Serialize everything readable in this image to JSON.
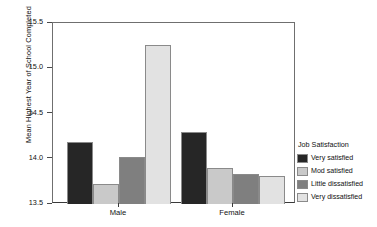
{
  "chart_data": {
    "type": "bar",
    "title": "",
    "xlabel": "",
    "ylabel": "Mean Highest Year of School Completed",
    "categories": [
      "Male",
      "Female"
    ],
    "ylim": [
      13.5,
      15.5
    ],
    "yticks": [
      "13.5",
      "14.0",
      "14.5",
      "15.0",
      "15.5"
    ],
    "ytick_values": [
      13.5,
      14.0,
      14.5,
      15.0,
      15.5
    ],
    "grid": false,
    "legend_position": "right",
    "legend_title": "Job Satisfaction",
    "series": [
      {
        "name": "Very satisfied",
        "color": "#262626",
        "values": [
          14.18,
          14.3
        ]
      },
      {
        "name": "Mod satisfied",
        "color": "#c9c9c9",
        "values": [
          13.72,
          13.9
        ]
      },
      {
        "name": "Little dissatisfied",
        "color": "#7f7f7f",
        "values": [
          14.02,
          13.83
        ]
      },
      {
        "name": "Very dissatisfied",
        "color": "#e2e2e2",
        "values": [
          15.26,
          13.81
        ]
      }
    ]
  },
  "axes": {
    "y_title": "Mean Highest Year of School Completed",
    "y_tick_labels": [
      "15.5",
      "15.0",
      "14.5",
      "14.0",
      "13.5"
    ],
    "x_tick_labels": [
      "Male",
      "Female"
    ]
  },
  "legend": {
    "title": "Job Satisfaction",
    "items": [
      {
        "label": "Very satisfied",
        "color": "#262626"
      },
      {
        "label": "Mod satisfied",
        "color": "#c9c9c9"
      },
      {
        "label": "Little dissatisfied",
        "color": "#7f7f7f"
      },
      {
        "label": "Very dissatisfied",
        "color": "#e2e2e2"
      }
    ]
  }
}
